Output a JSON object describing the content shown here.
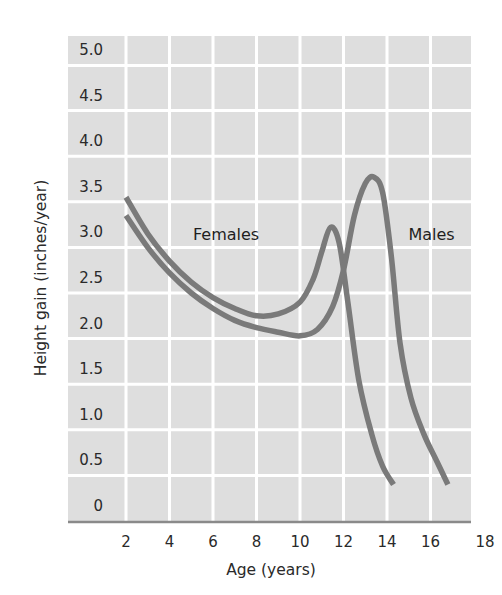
{
  "chart_data": {
    "type": "line",
    "title": "",
    "xlabel": "Age (years)",
    "ylabel": "Height gain (inches/year)",
    "xlim": [
      0,
      18
    ],
    "ylim": [
      0,
      5.0
    ],
    "x_ticks": [
      "2",
      "4",
      "6",
      "8",
      "10",
      "12",
      "14",
      "16",
      "18"
    ],
    "y_ticks": [
      "0",
      "0.5",
      "1.0",
      "1.5",
      "2.0",
      "2.5",
      "3.0",
      "3.5",
      "4.0",
      "4.5",
      "5.0"
    ],
    "grid": true,
    "legend": "inline labels",
    "series": [
      {
        "name": "Females",
        "label_position": {
          "x": 6.6,
          "y": 3.15
        },
        "points": [
          [
            2,
            3.55
          ],
          [
            3,
            3.15
          ],
          [
            4,
            2.85
          ],
          [
            5,
            2.62
          ],
          [
            6,
            2.45
          ],
          [
            7,
            2.33
          ],
          [
            8,
            2.25
          ],
          [
            9,
            2.27
          ],
          [
            10,
            2.4
          ],
          [
            10.6,
            2.65
          ],
          [
            11,
            2.95
          ],
          [
            11.4,
            3.22
          ],
          [
            11.8,
            3.05
          ],
          [
            12.2,
            2.4
          ],
          [
            12.7,
            1.55
          ],
          [
            13.3,
            0.95
          ],
          [
            13.8,
            0.6
          ],
          [
            14.3,
            0.4
          ]
        ]
      },
      {
        "name": "Males",
        "label_position": {
          "x": 16.05,
          "y": 3.15
        },
        "points": [
          [
            2,
            3.35
          ],
          [
            3,
            3.0
          ],
          [
            4,
            2.72
          ],
          [
            5,
            2.5
          ],
          [
            6,
            2.33
          ],
          [
            7,
            2.2
          ],
          [
            8,
            2.12
          ],
          [
            9,
            2.07
          ],
          [
            10,
            2.03
          ],
          [
            10.8,
            2.1
          ],
          [
            11.5,
            2.35
          ],
          [
            12,
            2.75
          ],
          [
            12.5,
            3.35
          ],
          [
            13,
            3.7
          ],
          [
            13.4,
            3.77
          ],
          [
            13.8,
            3.6
          ],
          [
            14.2,
            2.9
          ],
          [
            14.6,
            1.95
          ],
          [
            15.1,
            1.35
          ],
          [
            15.7,
            0.95
          ],
          [
            16.3,
            0.65
          ],
          [
            16.8,
            0.4
          ]
        ]
      }
    ],
    "colors": {
      "plot_background": "#dedede",
      "grid_lines": "#ffffff",
      "series_line": "#7a7a7a",
      "axis_line": "#8a8a8a",
      "text": "#2a2a2a"
    }
  }
}
